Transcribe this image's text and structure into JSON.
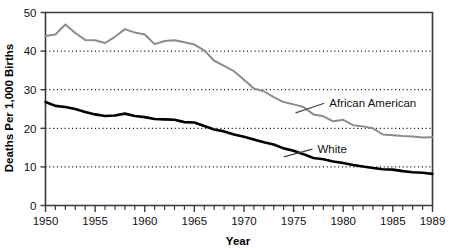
{
  "chart_data": {
    "type": "line",
    "title": "",
    "xlabel": "Year",
    "ylabel": "Deaths Per 1,000 Births",
    "xlim": [
      1950,
      1989
    ],
    "ylim": [
      0,
      50
    ],
    "yticks": [
      0,
      10,
      20,
      30,
      40,
      50
    ],
    "xticks": [
      1950,
      1955,
      1960,
      1965,
      1970,
      1975,
      1980,
      1985,
      1989
    ],
    "xtick_labels": [
      "1950",
      "1955",
      "1960",
      "1965",
      "1970",
      "1975",
      "1980",
      "1985",
      "1989"
    ],
    "ytick_labels": [
      "0",
      "10",
      "20",
      "30",
      "40",
      "50"
    ],
    "grid": "horizontal-dotted",
    "gridlines_at": [
      10,
      20,
      30,
      40
    ],
    "legend_position": "inline-annotation",
    "x": [
      1950,
      1951,
      1952,
      1953,
      1954,
      1955,
      1956,
      1957,
      1958,
      1959,
      1960,
      1961,
      1962,
      1963,
      1964,
      1965,
      1966,
      1967,
      1968,
      1969,
      1970,
      1971,
      1972,
      1973,
      1974,
      1975,
      1976,
      1977,
      1978,
      1979,
      1980,
      1981,
      1982,
      1983,
      1984,
      1985,
      1986,
      1987,
      1988,
      1989
    ],
    "series": [
      {
        "name": "African American",
        "color": "#8c8c8c",
        "label_x": 1978.2,
        "label_y": 26.5,
        "values": [
          43.9,
          44.3,
          46.9,
          44.7,
          42.9,
          42.8,
          42.1,
          43.7,
          45.7,
          44.8,
          44.3,
          41.8,
          42.6,
          42.8,
          42.3,
          41.7,
          40.2,
          37.5,
          36.2,
          34.8,
          32.6,
          30.3,
          29.6,
          28.1,
          26.8,
          26.2,
          25.5,
          23.6,
          23.1,
          21.8,
          22.2,
          20.8,
          20.5,
          20.0,
          18.4,
          18.2,
          18.0,
          17.9,
          17.6,
          17.7
        ]
      },
      {
        "name": "White",
        "color": "#000000",
        "label_x": 1977.0,
        "label_y": 14.6,
        "values": [
          26.8,
          25.8,
          25.5,
          25.0,
          24.2,
          23.6,
          23.2,
          23.3,
          23.8,
          23.2,
          22.9,
          22.4,
          22.3,
          22.2,
          21.6,
          21.5,
          20.6,
          19.7,
          19.2,
          18.4,
          17.8,
          17.1,
          16.4,
          15.8,
          14.8,
          14.2,
          13.3,
          12.3,
          12.0,
          11.4,
          11.0,
          10.5,
          10.1,
          9.7,
          9.4,
          9.3,
          8.9,
          8.6,
          8.5,
          8.2
        ]
      }
    ]
  }
}
